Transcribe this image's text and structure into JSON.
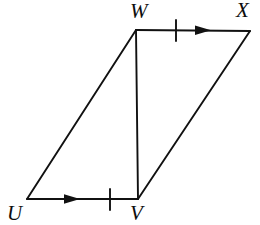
{
  "figure": {
    "kind": "geometry-diagram",
    "background_color": "#ffffff",
    "stroke_color": "#111111",
    "stroke_width": 1.9,
    "canvas": {
      "width": 260,
      "height": 225
    },
    "vertices": [
      {
        "id": "U",
        "label": "U",
        "x": 27,
        "y": 199
      },
      {
        "id": "V",
        "label": "V",
        "x": 138,
        "y": 199
      },
      {
        "id": "W",
        "label": "W",
        "x": 136,
        "y": 30
      },
      {
        "id": "X",
        "label": "X",
        "x": 250,
        "y": 31
      }
    ],
    "segments": [
      {
        "id": "UV",
        "from": "U",
        "to": "V",
        "name": "bottom-edge"
      },
      {
        "id": "VX",
        "from": "V",
        "to": "X",
        "name": "right-diagonal-edge"
      },
      {
        "id": "XW",
        "from": "X",
        "to": "W",
        "name": "top-edge"
      },
      {
        "id": "WU",
        "from": "W",
        "to": "U",
        "name": "left-diagonal-edge"
      },
      {
        "id": "WV",
        "from": "W",
        "to": "V",
        "name": "interior-diagonal"
      }
    ],
    "tick_marks": [
      {
        "on": "UV",
        "x": 110,
        "y": 199,
        "count": 1
      },
      {
        "on": "WX",
        "x": 176,
        "y": 30,
        "count": 1
      }
    ],
    "direction_arrows": [
      {
        "on": "UV",
        "x": 75,
        "y": 199,
        "points": "right"
      },
      {
        "on": "WX",
        "x": 206,
        "y": 30,
        "points": "right"
      }
    ],
    "labels": {
      "top_left": "W",
      "top_right": "X",
      "bottom_left": "U",
      "bottom_right": "V"
    }
  }
}
